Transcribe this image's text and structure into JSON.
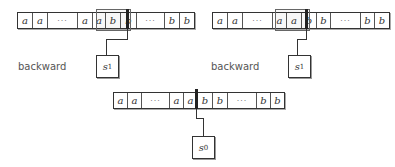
{
  "diagrams": [
    {
      "label": "backward",
      "cells": [
        "a",
        "a",
        "···",
        "a",
        "a",
        "b",
        "b",
        "···",
        "b",
        "b"
      ],
      "state": "s",
      "state_sub": "1"
    },
    {
      "label": "backward",
      "cells": [
        "a",
        "a",
        "···",
        "a",
        "a",
        "b",
        "b",
        "···",
        "b",
        "b"
      ],
      "state": "s",
      "state_sub": "1"
    },
    {
      "cells": [
        "a",
        "a",
        "···",
        "a",
        "a",
        "b",
        "b",
        "···",
        "b",
        "b"
      ],
      "state": "s",
      "state_sub": "0"
    }
  ]
}
